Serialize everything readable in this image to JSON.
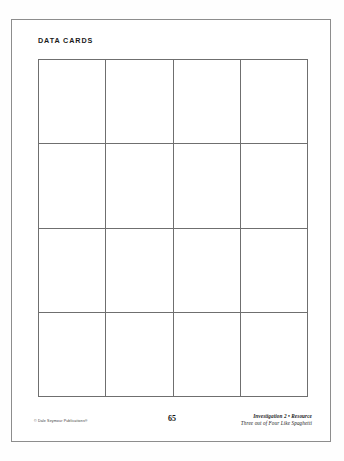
{
  "page": {
    "header_title": "DATA CARDS",
    "background_color": "#ffffff",
    "frame_color": "#8d8d8d",
    "grid_line_color": "#6f6f6f"
  },
  "grid": {
    "columns": 4,
    "rows": 4,
    "cells": [
      "",
      "",
      "",
      "",
      "",
      "",
      "",
      "",
      "",
      "",
      "",
      "",
      "",
      "",
      "",
      ""
    ]
  },
  "footer": {
    "copyright": "© Dale Seymour Publications®",
    "page_number": "65",
    "reference_line_1": "Investigation 2 • Resource",
    "reference_line_2": "Three out of Four Like Spaghetti"
  }
}
